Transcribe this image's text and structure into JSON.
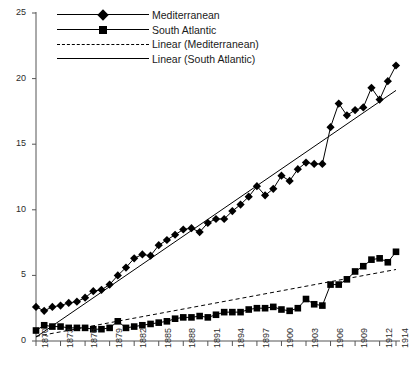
{
  "chart_data": {
    "type": "line",
    "title": "",
    "xlabel": "",
    "ylabel": "",
    "xlim": [
      1870,
      1914
    ],
    "ylim": [
      0,
      25
    ],
    "grid": false,
    "legend_position": "top-left",
    "x_ticks": [
      "1870",
      "1873",
      "1876",
      "1879",
      "1882",
      "1885",
      "1888",
      "1891",
      "1894",
      "1897",
      "1900",
      "1903",
      "1906",
      "1909",
      "1912",
      "1914"
    ],
    "y_ticks": [
      "0",
      "5",
      "10",
      "15",
      "20",
      "25"
    ],
    "x": [
      1870,
      1871,
      1872,
      1873,
      1874,
      1875,
      1876,
      1877,
      1878,
      1879,
      1880,
      1881,
      1882,
      1883,
      1884,
      1885,
      1886,
      1887,
      1888,
      1889,
      1890,
      1891,
      1892,
      1893,
      1894,
      1895,
      1896,
      1897,
      1898,
      1899,
      1900,
      1901,
      1902,
      1903,
      1904,
      1905,
      1906,
      1907,
      1908,
      1909,
      1910,
      1911,
      1912,
      1913,
      1914
    ],
    "series": [
      {
        "name": "Mediterranean",
        "marker": "diamond",
        "color": "#000000",
        "values": [
          2.6,
          2.3,
          2.6,
          2.7,
          2.9,
          3.0,
          3.3,
          3.8,
          3.9,
          4.3,
          5.0,
          5.6,
          6.3,
          6.6,
          6.5,
          7.3,
          7.7,
          8.1,
          8.5,
          8.6,
          8.3,
          9.0,
          9.3,
          9.3,
          9.9,
          10.4,
          11.0,
          11.8,
          11.1,
          11.6,
          12.6,
          12.2,
          13.1,
          13.6,
          13.5,
          13.5,
          16.3,
          18.1,
          17.2,
          17.6,
          17.8,
          19.3,
          18.4,
          19.8,
          21.0
        ]
      },
      {
        "name": "South Atlantic",
        "marker": "square",
        "color": "#000000",
        "values": [
          0.8,
          1.2,
          1.1,
          1.1,
          1.0,
          1.0,
          1.0,
          0.9,
          0.9,
          1.0,
          1.5,
          1.0,
          1.1,
          1.2,
          1.3,
          1.4,
          1.5,
          1.7,
          1.8,
          1.8,
          1.9,
          1.8,
          2.0,
          2.2,
          2.2,
          2.2,
          2.4,
          2.5,
          2.5,
          2.6,
          2.4,
          2.3,
          2.5,
          3.2,
          2.8,
          2.7,
          4.3,
          4.3,
          4.7,
          5.3,
          5.7,
          6.2,
          6.3,
          6.0,
          6.8
        ]
      }
    ],
    "trendlines": [
      {
        "name": "Linear (Mediterranean)",
        "style": "dashed",
        "color": "#000000",
        "x0": 1870,
        "y0": 0.35,
        "x1": 1914,
        "y1": 5.45
      },
      {
        "name": "Linear (South Atlantic)",
        "style": "solid",
        "color": "#000000",
        "x0": 1870,
        "y0": 0.3,
        "x1": 1914,
        "y1": 19.1
      }
    ],
    "legend": [
      {
        "label": "Mediterranean",
        "style": "solid",
        "marker": "diamond"
      },
      {
        "label": "South Atlantic",
        "style": "solid",
        "marker": "square"
      },
      {
        "label": "Linear (Mediterranean)",
        "style": "dashed",
        "marker": "none"
      },
      {
        "label": "Linear (South Atlantic)",
        "style": "solid",
        "marker": "none"
      }
    ]
  }
}
